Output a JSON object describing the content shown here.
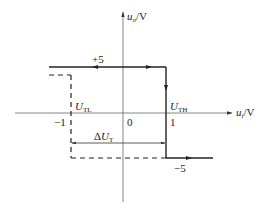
{
  "diagram": {
    "type": "hysteresis transfer characteristic",
    "axes": {
      "y_label_var": "u",
      "y_label_sub": "o",
      "y_label_unit": "/V",
      "x_label_var": "u",
      "x_label_sub": "i",
      "x_label_unit": "/V",
      "origin": "0"
    },
    "levels": {
      "high": "+5",
      "low": "−5"
    },
    "thresholds": {
      "low_var": "U",
      "low_sub": "TL",
      "low_value": "−1",
      "high_var": "U",
      "high_sub": "TH",
      "high_value": "1"
    },
    "width_label": {
      "prefix": "Δ",
      "var": "U",
      "sub": "T"
    },
    "colors": {
      "line": "#222222",
      "axis": "#555555"
    }
  }
}
